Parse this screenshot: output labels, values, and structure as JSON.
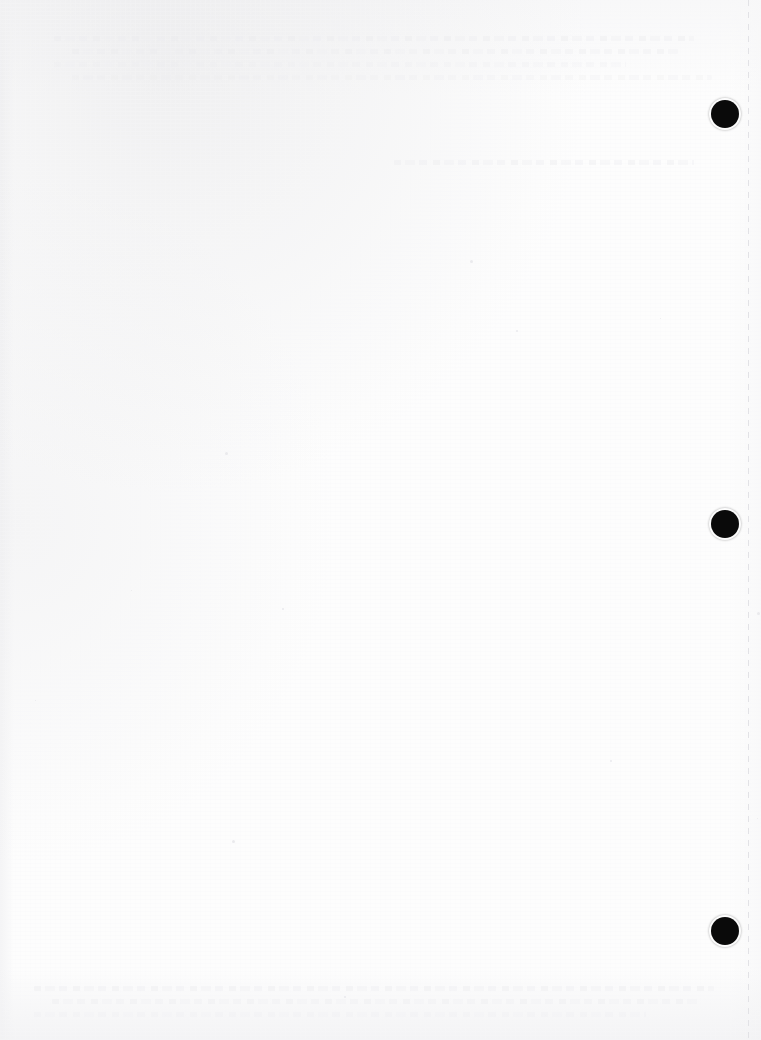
{
  "page": {
    "label": "scanned-blank-page",
    "width": 761,
    "height": 1040,
    "background_color": "#fdfdfd",
    "visible_text": "",
    "note": "Blank scanned sheet; no legible printed text."
  },
  "marks": {
    "color": "#0a0a0a",
    "shape": "filled-circle",
    "diameter": 28,
    "items": [
      {
        "name": "registration-mark-top",
        "cx": 725,
        "cy": 114
      },
      {
        "name": "registration-mark-middle",
        "cx": 725,
        "cy": 524
      },
      {
        "name": "registration-mark-bottom",
        "cx": 725,
        "cy": 931
      }
    ]
  },
  "perforation": {
    "name": "perforation-line",
    "x": 748,
    "color": "#e1e1e5",
    "style": "dashed-vertical"
  },
  "bleed_through": {
    "color": "#eaeaed",
    "bands": [
      {
        "name": "bleed-band-top",
        "x": 60,
        "y": 36,
        "width": 640,
        "lines": 4
      },
      {
        "name": "bleed-band-upper",
        "x": 400,
        "y": 160,
        "width": 300,
        "lines": 1
      },
      {
        "name": "bleed-band-bottom",
        "x": 40,
        "y": 986,
        "width": 680,
        "lines": 3
      }
    ]
  },
  "specks": [
    {
      "x": 131,
      "y": 590
    },
    {
      "x": 282,
      "y": 608
    },
    {
      "x": 1255,
      "y": 612
    },
    {
      "x": 35,
      "y": 700
    },
    {
      "x": 610,
      "y": 760
    },
    {
      "x": 232,
      "y": 840
    },
    {
      "x": 905,
      "y": 818
    },
    {
      "x": 344,
      "y": 996
    },
    {
      "x": 470,
      "y": 260
    },
    {
      "x": 660,
      "y": 318
    },
    {
      "x": 516,
      "y": 330
    },
    {
      "x": 225,
      "y": 452
    }
  ]
}
